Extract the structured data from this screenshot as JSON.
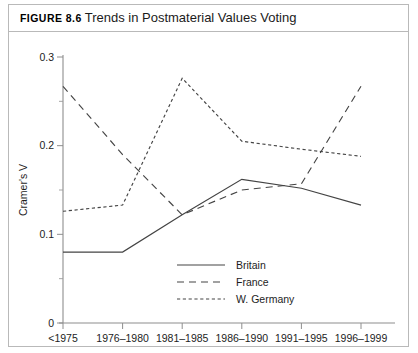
{
  "figure": {
    "label": "Figure 8.6",
    "caption": "Trends in Postmaterial Values Voting"
  },
  "chart_data": {
    "type": "line",
    "title": "Trends in Postmaterial Values Voting",
    "xlabel": "",
    "ylabel": "Cramer's V",
    "categories": [
      "<1975",
      "1976–1980",
      "1981–1985",
      "1986–1990",
      "1991–1995",
      "1996–1999"
    ],
    "ylim": [
      0,
      0.3
    ],
    "yticks": [
      0,
      0.1,
      0.2,
      0.3
    ],
    "ytick_labels": [
      "0",
      "0.1",
      "0.2",
      "0.3"
    ],
    "yminor_ticks": [
      0.05,
      0.15,
      0.25
    ],
    "grid": false,
    "legend_position": "bottom-right",
    "series": [
      {
        "name": "Britain",
        "style": "solid",
        "values": [
          0.08,
          0.08,
          0.122,
          0.162,
          0.152,
          0.133
        ]
      },
      {
        "name": "France",
        "style": "dashed",
        "values": [
          0.267,
          0.19,
          0.122,
          0.15,
          0.157,
          0.267
        ]
      },
      {
        "name": "W. Germany",
        "style": "dotted",
        "values": [
          0.126,
          0.133,
          0.276,
          0.205,
          0.196,
          0.188
        ]
      }
    ]
  },
  "legend": {
    "items": [
      {
        "label": "Britain"
      },
      {
        "label": "France"
      },
      {
        "label": "W. Germany"
      }
    ]
  }
}
